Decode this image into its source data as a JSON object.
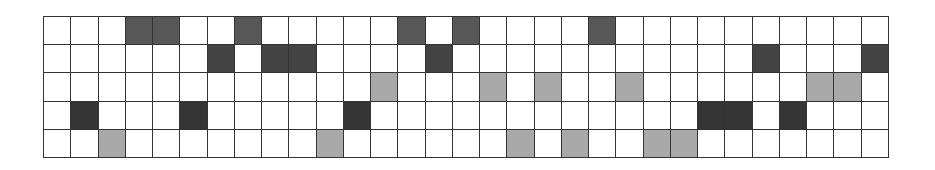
{
  "grid": {
    "columns": 31,
    "rows": 5,
    "colors": {
      "empty": "#ffffff",
      "dark_a": "#575757",
      "dark_b": "#434343",
      "dark_c": "#353535",
      "light": "#a9a9a9",
      "line": "#333333"
    },
    "cells": [
      ".,.,.,A,A,.,.,A,.,.,.,.,.,A,.,A,.,.,.,.,A,.,.,.,.,.,.,.,.,.,.",
      ".,.,.,.,.,.,B,.,B,B,.,.,.,.,B,.,.,.,.,.,.,.,.,.,.,.,B,.,.,.,B",
      ".,.,.,.,.,.,.,.,.,.,.,.,L,.,.,.,L,.,L,.,.,L,.,.,.,.,.,.,L,L,.",
      ".,C,.,.,.,C,.,.,.,.,.,C,.,.,.,.,.,.,.,.,.,.,.,.,C,C,.,C,.,.,.",
      ".,.,L,.,.,.,.,.,.,.,L,.,.,.,.,.,.,L,.,L,.,.,L,L,.,.,.,.,.,.,."
    ],
    "legend": {
      ".": "empty",
      "A": "dark",
      "B": "dark",
      "C": "dark",
      "L": "light-gray"
    }
  }
}
